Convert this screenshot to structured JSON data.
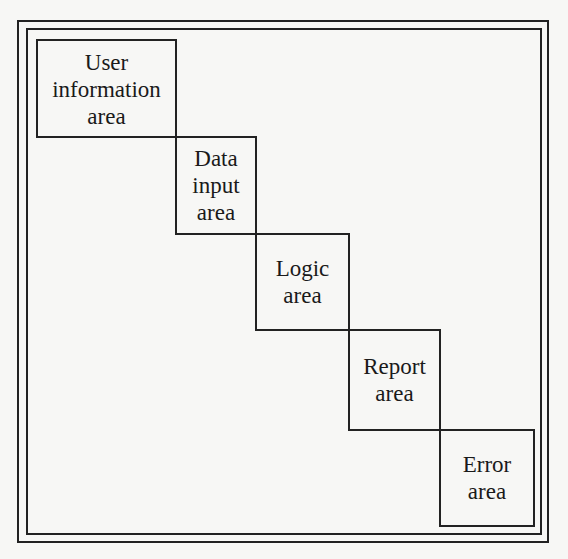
{
  "diagram": {
    "type": "staircase-layout",
    "frame": "double-border",
    "areas": [
      {
        "id": "user-information",
        "label": "User\ninformation\narea",
        "box": {
          "x": 36,
          "y": 39,
          "w": 141,
          "h": 99
        }
      },
      {
        "id": "data-input",
        "label": "Data\ninput\narea",
        "box": {
          "x": 175,
          "y": 136,
          "w": 82,
          "h": 99
        }
      },
      {
        "id": "logic",
        "label": "Logic\narea",
        "box": {
          "x": 255,
          "y": 233,
          "w": 95,
          "h": 98
        }
      },
      {
        "id": "report",
        "label": "Report\narea",
        "box": {
          "x": 348,
          "y": 329,
          "w": 93,
          "h": 102
        }
      },
      {
        "id": "error",
        "label": "Error\narea",
        "box": {
          "x": 439,
          "y": 429,
          "w": 96,
          "h": 98
        }
      }
    ]
  }
}
